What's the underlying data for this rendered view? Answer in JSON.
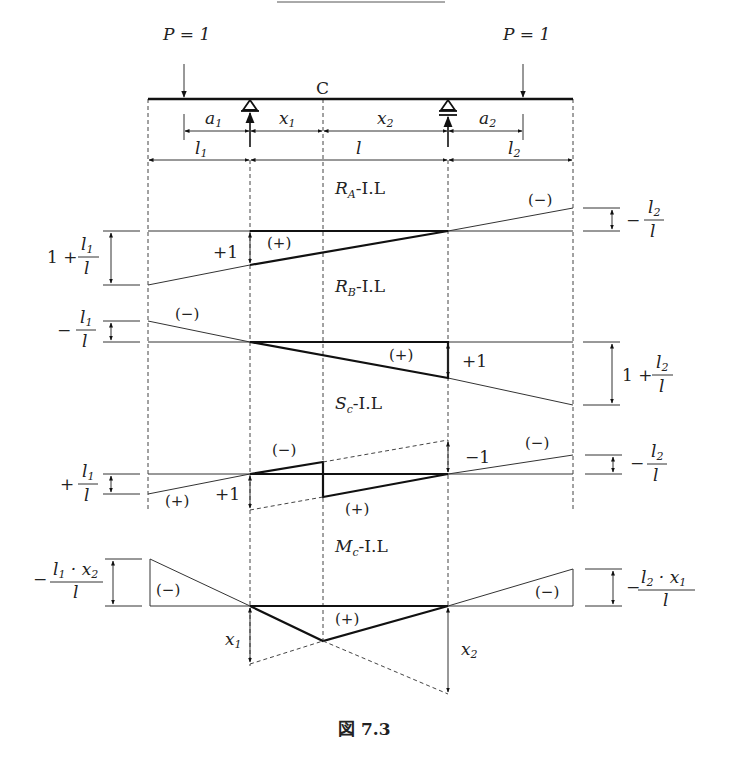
{
  "figure": {
    "caption": "図 7.3",
    "load_left": "P = 1",
    "load_right": "P = 1",
    "point_c": "C",
    "dims_top": {
      "a1": "a",
      "a1_sub": "1",
      "x1": "x",
      "x1_sub": "1",
      "x2": "x",
      "x2_sub": "2",
      "a2": "a",
      "a2_sub": "2"
    },
    "dims_bottom": {
      "l1": "l",
      "l1_sub": "1",
      "l": "l",
      "l2": "l",
      "l2_sub": "2"
    }
  },
  "diagrams": {
    "ra": {
      "title_main": "R",
      "title_sub": "A",
      "title_suffix": "-I.L",
      "left_value": "1 + l₁/l",
      "left_num": "l",
      "left_num_sub": "1",
      "left_den": "l",
      "left_prefix": "1 +",
      "mid_value": "+1",
      "right_value": "− l₂/l",
      "right_prefix": "−",
      "right_num": "l",
      "right_num_sub": "2",
      "right_den": "l",
      "sign_pos": "(+)",
      "sign_neg": "(−)"
    },
    "rb": {
      "title_main": "R",
      "title_sub": "B",
      "title_suffix": "-I.L",
      "left_value": "− l₁/l",
      "left_prefix": "−",
      "left_num": "l",
      "left_num_sub": "1",
      "left_den": "l",
      "mid_value": "+1",
      "right_value": "1 + l₂/l",
      "right_prefix": "1 +",
      "right_num": "l",
      "right_num_sub": "2",
      "right_den": "l",
      "sign_pos": "(+)",
      "sign_neg": "(−)"
    },
    "sc": {
      "title_main": "S",
      "title_sub": "c",
      "title_suffix": "-I.L",
      "left_value": "+ l₁/l",
      "left_prefix": "+",
      "left_num": "l",
      "left_num_sub": "1",
      "left_den": "l",
      "mid_pos_value": "+1",
      "mid_neg_value": "−1",
      "right_value": "− l₂/l",
      "right_prefix": "−",
      "right_num": "l",
      "right_num_sub": "2",
      "right_den": "l",
      "sign_pos_left": "(+)",
      "sign_neg_mid": "(−)",
      "sign_pos_mid": "(+)",
      "sign_neg_right": "(−)"
    },
    "mc": {
      "title_main": "M",
      "title_sub": "c",
      "title_suffix": "-I.L",
      "left_value": "− l₁·x₂/l",
      "left_prefix": "−",
      "left_num": "l",
      "left_num_sub": "1",
      "left_num_mid": " · x",
      "left_num_sub2": "2",
      "left_den": "l",
      "right_value": "− l₂·x₁/l",
      "right_prefix": "−",
      "right_num": "l",
      "right_num_sub": "2",
      "right_num_mid": " · x",
      "right_num_sub2": "1",
      "right_den": "l",
      "x1_label": "x",
      "x1_sub": "1",
      "x2_label": "x",
      "x2_sub": "2",
      "sign_neg_left": "(−)",
      "sign_pos": "(+)",
      "sign_neg_right": "(−)"
    }
  }
}
